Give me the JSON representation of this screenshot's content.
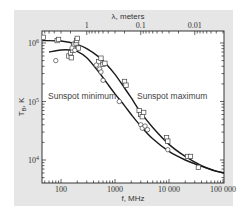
{
  "chart_data": {
    "type": "line",
    "title": "",
    "xlabel": "f, MHz",
    "ylabel": "T_B, K",
    "x_scale": "log",
    "y_scale": "log",
    "xlim": [
      45,
      120000
    ],
    "ylim": [
      3800,
      1600000
    ],
    "x_ticks": [
      {
        "value": 100,
        "label": "100"
      },
      {
        "value": 1000,
        "label": "1000"
      },
      {
        "value": 10000,
        "label": "10 000"
      },
      {
        "value": 100000,
        "label": "100 000"
      }
    ],
    "y_ticks": [
      {
        "value": 1000000,
        "label_base": "10",
        "label_exp": "6"
      },
      {
        "value": 100000,
        "label_base": "10",
        "label_exp": "5"
      },
      {
        "value": 10000,
        "label_base": "10",
        "label_exp": "4"
      }
    ],
    "top_axis": {
      "label": "λ, meters",
      "ticks": [
        {
          "value_m": 1,
          "label": "1"
        },
        {
          "value_m": 0.1,
          "label": "0.1"
        },
        {
          "value_m": 0.01,
          "label": "0.01"
        }
      ]
    },
    "grid": false,
    "annotations": [
      {
        "text": "Sunspot minimum",
        "x_mhz": 55,
        "y_k": 180000
      },
      {
        "text": "Sunspot maximum",
        "x_mhz": 2700,
        "y_k": 180000
      }
    ],
    "series": [
      {
        "name": "Sunspot maximum",
        "kind": "curve",
        "points": [
          [
            45,
            1100000
          ],
          [
            100,
            1080000
          ],
          [
            200,
            950000
          ],
          [
            300,
            800000
          ],
          [
            500,
            580000
          ],
          [
            700,
            430000
          ],
          [
            1000,
            290000
          ],
          [
            1500,
            170000
          ],
          [
            2000,
            115000
          ],
          [
            3000,
            65000
          ],
          [
            5000,
            36000
          ],
          [
            10000,
            18500
          ],
          [
            20000,
            11500
          ],
          [
            40000,
            8000
          ],
          [
            70000,
            6600
          ],
          [
            120000,
            5900
          ]
        ]
      },
      {
        "name": "Sunspot minimum",
        "kind": "curve",
        "points": [
          [
            60,
            700000
          ],
          [
            100,
            760000
          ],
          [
            150,
            760000
          ],
          [
            200,
            720000
          ],
          [
            300,
            560000
          ],
          [
            500,
            320000
          ],
          [
            700,
            210000
          ],
          [
            1000,
            135000
          ],
          [
            1500,
            85000
          ],
          [
            2000,
            60000
          ],
          [
            3000,
            38000
          ],
          [
            5000,
            23000
          ],
          [
            10000,
            14000
          ],
          [
            20000,
            10000
          ],
          [
            40000,
            7800
          ],
          [
            70000,
            6500
          ],
          [
            120000,
            5800
          ]
        ]
      },
      {
        "name": "Sunspot maximum observations",
        "kind": "squares",
        "points": [
          [
            47,
            1250000
          ],
          [
            85,
            1100000
          ],
          [
            90,
            1150000
          ],
          [
            140,
            600000
          ],
          [
            150,
            680000
          ],
          [
            155,
            560000
          ],
          [
            165,
            750000
          ],
          [
            170,
            880000
          ],
          [
            175,
            950000
          ],
          [
            190,
            1000000
          ],
          [
            195,
            1100000
          ],
          [
            200,
            1200000
          ],
          [
            210,
            820000
          ],
          [
            500,
            480000
          ],
          [
            550,
            550000
          ],
          [
            600,
            430000
          ],
          [
            650,
            450000
          ],
          [
            1500,
            220000
          ],
          [
            1600,
            190000
          ],
          [
            2800,
            70000
          ],
          [
            3000,
            60000
          ],
          [
            3200,
            55000
          ],
          [
            3400,
            65000
          ],
          [
            9000,
            24000
          ],
          [
            9500,
            21000
          ],
          [
            22000,
            11500
          ],
          [
            25000,
            11500
          ],
          [
            35000,
            7500
          ]
        ]
      },
      {
        "name": "Sunspot minimum observations",
        "kind": "circles",
        "points": [
          [
            80,
            500000
          ],
          [
            160,
            820000
          ],
          [
            180,
            750000
          ],
          [
            450,
            420000
          ],
          [
            520,
            360000
          ],
          [
            550,
            320000
          ],
          [
            600,
            230000
          ],
          [
            1200,
            100000
          ],
          [
            3000,
            40000
          ],
          [
            3200,
            35000
          ],
          [
            3600,
            38000
          ],
          [
            4000,
            33000
          ],
          [
            9500,
            15000
          ]
        ]
      }
    ]
  }
}
